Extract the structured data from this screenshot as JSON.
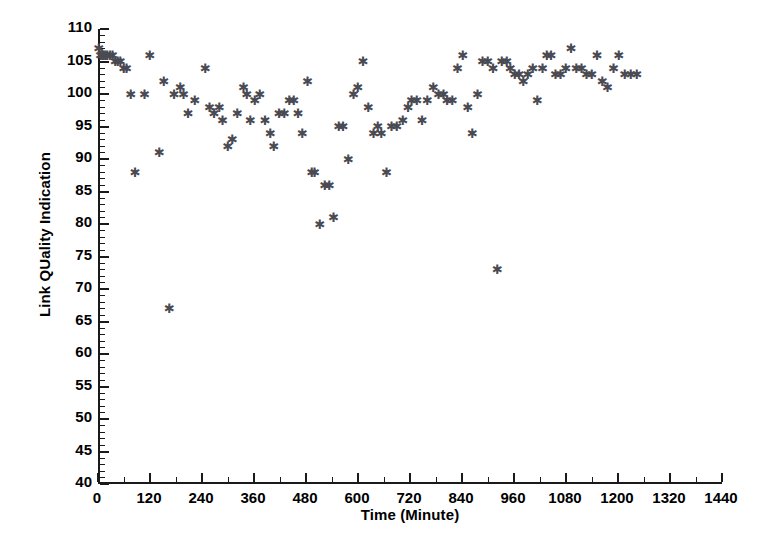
{
  "chart_data": {
    "type": "scatter",
    "title": "",
    "xlabel": "Time (Minute)",
    "ylabel": "Link QUality Indication",
    "xlim": [
      0,
      1440
    ],
    "ylim": [
      40,
      110
    ],
    "xticks": [
      0,
      120,
      240,
      360,
      480,
      600,
      720,
      840,
      960,
      1080,
      1200,
      1320,
      1440
    ],
    "yticks": [
      40,
      45,
      50,
      55,
      60,
      65,
      70,
      75,
      80,
      85,
      90,
      95,
      100,
      105,
      110
    ],
    "xtick_labels": [
      "0",
      "120",
      "240",
      "360",
      "480",
      "600",
      "720",
      "840",
      "960",
      "1080",
      "1200",
      "1320",
      "1440"
    ],
    "ytick_labels": [
      "40",
      "45",
      "50",
      "55",
      "60",
      "65",
      "70",
      "75",
      "80",
      "85",
      "90",
      "95",
      "100",
      "105",
      "110"
    ],
    "grid": false,
    "legend": null,
    "marker": "asterisk",
    "marker_color": "#4a4a52",
    "series": [
      {
        "name": "Link Quality Indication",
        "points": [
          [
            2,
            107
          ],
          [
            6,
            106
          ],
          [
            10,
            106
          ],
          [
            14,
            106
          ],
          [
            18,
            106
          ],
          [
            22,
            106
          ],
          [
            28,
            106
          ],
          [
            34,
            106
          ],
          [
            40,
            105
          ],
          [
            46,
            105
          ],
          [
            52,
            105
          ],
          [
            60,
            104
          ],
          [
            66,
            104
          ],
          [
            76,
            100
          ],
          [
            86,
            88
          ],
          [
            108,
            100
          ],
          [
            120,
            106
          ],
          [
            142,
            91
          ],
          [
            152,
            102
          ],
          [
            165,
            67
          ],
          [
            176,
            100
          ],
          [
            190,
            101
          ],
          [
            198,
            100
          ],
          [
            208,
            97
          ],
          [
            224,
            99
          ],
          [
            248,
            104
          ],
          [
            258,
            98
          ],
          [
            268,
            97
          ],
          [
            280,
            98
          ],
          [
            288,
            96
          ],
          [
            300,
            92
          ],
          [
            310,
            93
          ],
          [
            322,
            97
          ],
          [
            336,
            101
          ],
          [
            344,
            100
          ],
          [
            352,
            96
          ],
          [
            362,
            99
          ],
          [
            374,
            100
          ],
          [
            386,
            96
          ],
          [
            398,
            94
          ],
          [
            406,
            92
          ],
          [
            418,
            97
          ],
          [
            430,
            97
          ],
          [
            442,
            99
          ],
          [
            452,
            99
          ],
          [
            462,
            97
          ],
          [
            472,
            94
          ],
          [
            484,
            102
          ],
          [
            494,
            88
          ],
          [
            500,
            88
          ],
          [
            512,
            80
          ],
          [
            524,
            86
          ],
          [
            534,
            86
          ],
          [
            544,
            81
          ],
          [
            556,
            95
          ],
          [
            566,
            95
          ],
          [
            578,
            90
          ],
          [
            590,
            100
          ],
          [
            600,
            101
          ],
          [
            612,
            105
          ],
          [
            624,
            98
          ],
          [
            636,
            94
          ],
          [
            646,
            95
          ],
          [
            654,
            94
          ],
          [
            666,
            88
          ],
          [
            678,
            95
          ],
          [
            690,
            95
          ],
          [
            704,
            96
          ],
          [
            716,
            98
          ],
          [
            724,
            99
          ],
          [
            736,
            99
          ],
          [
            748,
            96
          ],
          [
            760,
            99
          ],
          [
            774,
            101
          ],
          [
            786,
            100
          ],
          [
            798,
            100
          ],
          [
            806,
            99
          ],
          [
            818,
            99
          ],
          [
            830,
            104
          ],
          [
            842,
            106
          ],
          [
            854,
            98
          ],
          [
            864,
            94
          ],
          [
            876,
            100
          ],
          [
            888,
            105
          ],
          [
            900,
            105
          ],
          [
            912,
            104
          ],
          [
            922,
            73
          ],
          [
            932,
            105
          ],
          [
            944,
            105
          ],
          [
            952,
            104
          ],
          [
            962,
            103
          ],
          [
            972,
            103
          ],
          [
            982,
            102
          ],
          [
            992,
            103
          ],
          [
            1004,
            104
          ],
          [
            1014,
            99
          ],
          [
            1026,
            104
          ],
          [
            1036,
            106
          ],
          [
            1046,
            106
          ],
          [
            1056,
            103
          ],
          [
            1068,
            103
          ],
          [
            1080,
            104
          ],
          [
            1092,
            107
          ],
          [
            1104,
            104
          ],
          [
            1116,
            104
          ],
          [
            1128,
            103
          ],
          [
            1140,
            103
          ],
          [
            1152,
            106
          ],
          [
            1164,
            102
          ],
          [
            1176,
            101
          ],
          [
            1190,
            104
          ],
          [
            1202,
            106
          ],
          [
            1216,
            103
          ],
          [
            1230,
            103
          ],
          [
            1244,
            103
          ]
        ]
      }
    ]
  }
}
